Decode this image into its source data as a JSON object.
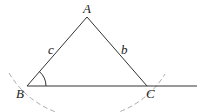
{
  "diagram": {
    "type": "triangle-construction",
    "vertices": {
      "A": {
        "label": "A",
        "x": 87,
        "y": 17,
        "label_x": 83,
        "label_y": 13
      },
      "B": {
        "label": "B",
        "x": 27,
        "y": 86,
        "label_x": 16,
        "label_y": 98
      },
      "C": {
        "label": "C",
        "x": 147,
        "y": 86,
        "label_x": 146,
        "label_y": 98
      }
    },
    "sides": {
      "c": {
        "label": "c",
        "x": 48,
        "y": 54
      },
      "b": {
        "label": "b",
        "x": 121,
        "y": 54
      }
    },
    "baseline_end_x": 197,
    "angle_marker_at": "B",
    "arc": {
      "center": "A",
      "radius": 91,
      "style": "dashed"
    },
    "colors": {
      "line": "#333333",
      "arc": "#aaaaaa",
      "text": "#222222"
    }
  }
}
